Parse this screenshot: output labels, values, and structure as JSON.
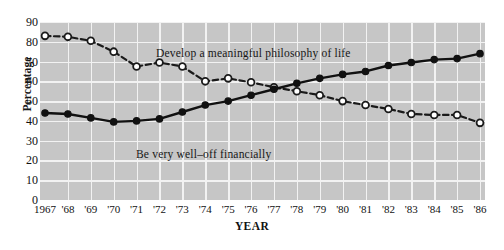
{
  "chart_data": {
    "type": "line",
    "title": "",
    "xlabel": "YEAR",
    "ylabel": "Percentage",
    "ylim": [
      0,
      90
    ],
    "ytick_step": 10,
    "yticks": [
      90,
      80,
      70,
      60,
      50,
      40,
      30,
      20,
      10,
      0
    ],
    "grid": true,
    "legend_position": "inline-annotation",
    "x": [
      1967,
      1968,
      1969,
      1970,
      1971,
      1972,
      1973,
      1974,
      1975,
      1976,
      1977,
      1978,
      1979,
      1980,
      1981,
      1982,
      1983,
      1984,
      1985,
      1986
    ],
    "categories": [
      "1967",
      "'68",
      "'69",
      "'70",
      "'71",
      "'72",
      "'73",
      "'74",
      "'75",
      "'76",
      "'77",
      "'78",
      "'79",
      "'80",
      "'81",
      "'82",
      "'83",
      "'84",
      "'85",
      "'86"
    ],
    "series": [
      {
        "name": "Develop a meaningful philosophy of life",
        "marker": "open-circle",
        "linestyle": "dashed",
        "color": "#1a1a1a",
        "values": [
          83,
          82.5,
          80.5,
          75,
          67.5,
          69.5,
          67.5,
          60,
          61.5,
          59.5,
          57,
          55,
          53,
          50,
          48,
          46,
          43.5,
          43,
          43,
          39
        ]
      },
      {
        "name": "Be very well-off financially",
        "marker": "filled-circle",
        "linestyle": "solid",
        "color": "#111111",
        "values": [
          44,
          43.5,
          41.5,
          39.5,
          40,
          41,
          44.5,
          48,
          50,
          53,
          56,
          59,
          61.5,
          63.5,
          65,
          68,
          69.5,
          71,
          71.5,
          74
        ]
      }
    ],
    "annotations": [
      {
        "text": "Develop a meaningful philosophy of life",
        "x": 1972,
        "y": 75
      },
      {
        "text": "Be very well–off financially",
        "x": 1971.5,
        "y": 34
      }
    ],
    "colors": {
      "plot_background": "#c6c6c6",
      "gridline": "#f2f2f2",
      "line": "#121212",
      "page_background": "#ffffff"
    }
  },
  "axes": {
    "y_title": "Percentage",
    "x_title": "YEAR"
  }
}
